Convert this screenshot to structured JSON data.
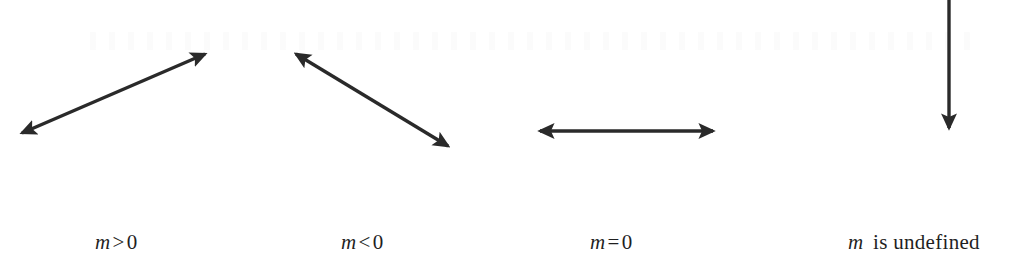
{
  "figure": {
    "background_color": "#ffffff",
    "stroke_color": "#2a2a2a",
    "text_color": "#1f1f1f",
    "width": 1030,
    "height": 280
  },
  "arrows": [
    {
      "id": "arrow-positive-slope",
      "name": "double-headed-arrow-up-right",
      "description": "Line rising from lower-left to upper-right",
      "heads": "both",
      "x1": 22,
      "y1": 133,
      "x2": 205,
      "y2": 54
    },
    {
      "id": "arrow-negative-slope",
      "name": "double-headed-arrow-down-right",
      "description": "Line falling from upper-left to lower-right",
      "heads": "both",
      "x1": 296,
      "y1": 54,
      "x2": 448,
      "y2": 146
    },
    {
      "id": "arrow-zero-slope",
      "name": "double-headed-arrow-horizontal",
      "description": "Horizontal line",
      "heads": "both",
      "x1": 540,
      "y1": 131,
      "x2": 713,
      "y2": 131
    },
    {
      "id": "arrow-undefined-slope",
      "name": "single-headed-arrow-down",
      "description": "Vertical line pointing down, cropped at top edge",
      "heads": "end",
      "x1": 949,
      "y1": -2,
      "x2": 949,
      "y2": 128
    }
  ],
  "labels": [
    {
      "id": "label-positive-slope",
      "variable": "m",
      "operator": ">",
      "value": "0",
      "kind": "relation"
    },
    {
      "id": "label-negative-slope",
      "variable": "m",
      "operator": "<",
      "value": "0",
      "kind": "relation"
    },
    {
      "id": "label-zero-slope",
      "variable": "m",
      "operator": "=",
      "value": "0",
      "kind": "relation"
    },
    {
      "id": "label-undefined-slope",
      "variable": "m",
      "operator": "",
      "value": "is undefined",
      "kind": "phrase"
    }
  ]
}
